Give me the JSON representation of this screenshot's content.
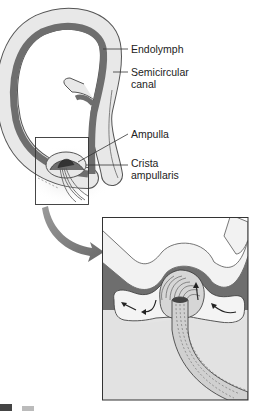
{
  "figure": {
    "labels": {
      "endolymph": "Endolymph",
      "semicircular_canal": "Semicircular\ncanal",
      "ampulla": "Ampulla",
      "crista_ampullaris": "Crista\nampullaris"
    },
    "colors": {
      "canal_wall": "#e6e6e6",
      "endolymph_fill": "#6e6e6e",
      "outline": "#444444",
      "tissue": "#d9d9d9",
      "arrow": "#7a7a7a",
      "background": "#ffffff"
    }
  }
}
